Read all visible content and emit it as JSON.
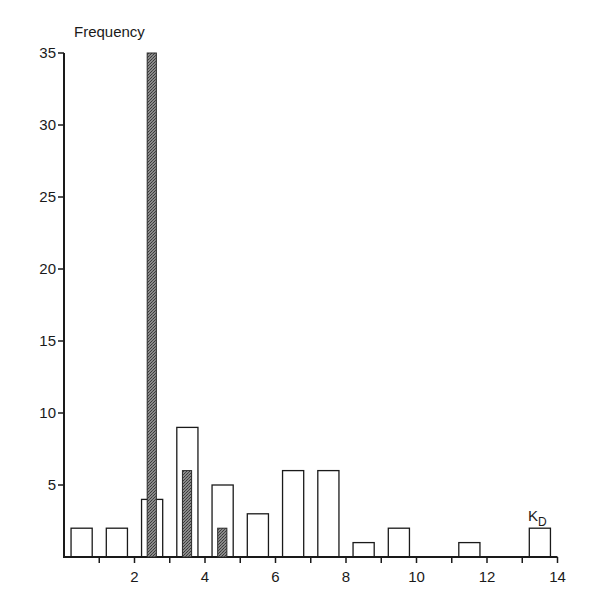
{
  "chart_data": {
    "type": "bar",
    "title": "",
    "xlabel": "K_D",
    "xlabel_main": "K",
    "xlabel_sub": "D",
    "ylabel": "Frequency",
    "xlim": [
      0,
      14
    ],
    "ylim": [
      0,
      35
    ],
    "x_ticks_labeled": [
      2,
      4,
      6,
      8,
      10,
      12,
      14
    ],
    "x_ticks_minor": [
      1,
      3,
      5,
      7,
      9,
      11,
      13
    ],
    "y_ticks": [
      5,
      10,
      15,
      20,
      25,
      30,
      35
    ],
    "grid": false,
    "legend": null,
    "series": [
      {
        "name": "open bars",
        "style": "outline",
        "bins": [
          {
            "x0": 0.2,
            "x1": 0.8,
            "value": 2
          },
          {
            "x0": 1.2,
            "x1": 1.8,
            "value": 2
          },
          {
            "x0": 2.2,
            "x1": 2.8,
            "value": 4
          },
          {
            "x0": 3.2,
            "x1": 3.8,
            "value": 9
          },
          {
            "x0": 4.2,
            "x1": 4.8,
            "value": 5
          },
          {
            "x0": 5.2,
            "x1": 5.8,
            "value": 3
          },
          {
            "x0": 6.2,
            "x1": 6.8,
            "value": 6
          },
          {
            "x0": 7.2,
            "x1": 7.8,
            "value": 6
          },
          {
            "x0": 8.2,
            "x1": 8.8,
            "value": 1
          },
          {
            "x0": 9.2,
            "x1": 9.8,
            "value": 2
          },
          {
            "x0": 11.2,
            "x1": 11.8,
            "value": 1
          },
          {
            "x0": 13.2,
            "x1": 13.8,
            "value": 2
          }
        ]
      },
      {
        "name": "shaded bars",
        "style": "stippled",
        "color": "#6b6b6b",
        "bins": [
          {
            "x0": 2.36,
            "x1": 2.62,
            "value": 35
          },
          {
            "x0": 3.36,
            "x1": 3.62,
            "value": 6
          },
          {
            "x0": 4.36,
            "x1": 4.62,
            "value": 2
          }
        ]
      }
    ]
  }
}
